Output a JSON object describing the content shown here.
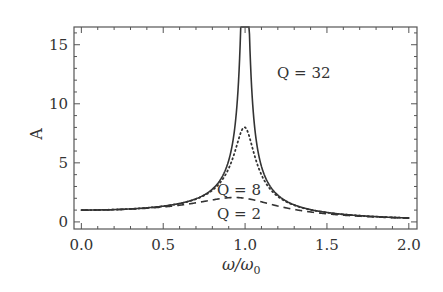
{
  "chart_data": {
    "type": "line",
    "title": "",
    "xlabel": "ω/ω",
    "xlabel_subscript": "0",
    "ylabel": "A",
    "xlim": [
      -0.045,
      2.05
    ],
    "ylim": [
      -0.6,
      16.5
    ],
    "grid": false,
    "x_ticks": [
      0.0,
      0.5,
      1.0,
      1.5,
      2.0
    ],
    "x_tick_labels": [
      "0.0",
      "0.5",
      "1.0",
      "1.5",
      "2.0"
    ],
    "y_ticks": [
      0,
      5,
      10,
      15
    ],
    "y_tick_labels": [
      "0",
      "5",
      "10",
      "15"
    ],
    "formula": "A = 1/sqrt((1-x^2)^2 + (x/Q)^2)",
    "x": [
      0.0,
      0.25,
      0.5,
      0.75,
      0.9,
      0.95,
      1.0,
      1.05,
      1.1,
      1.25,
      1.5,
      1.75,
      2.0
    ],
    "series": [
      {
        "name": "Q = 32",
        "style": "solid",
        "Q": 32,
        "values": [
          1.0,
          1.07,
          1.33,
          2.28,
          5.19,
          9.6,
          16.0,
          8.9,
          4.6,
          1.77,
          0.8,
          0.48,
          0.33
        ]
      },
      {
        "name": "Q = 8",
        "style": "dotted",
        "Q": 8,
        "values": [
          1.0,
          1.07,
          1.33,
          2.24,
          4.8,
          7.0,
          8.0,
          6.6,
          4.3,
          1.75,
          0.8,
          0.48,
          0.33
        ]
      },
      {
        "name": "Q = 2",
        "style": "dashed",
        "Q": 2,
        "values": [
          1.0,
          1.06,
          1.28,
          1.87,
          2.08,
          2.06,
          2.0,
          1.9,
          1.73,
          1.25,
          0.71,
          0.45,
          0.32
        ]
      }
    ],
    "annotations": [
      {
        "text": "Q = 32",
        "x": 1.13,
        "y": 12.3
      },
      {
        "text": "Q = 8",
        "x": 0.87,
        "y": 2.9
      },
      {
        "text": "Q = 2",
        "x": 0.87,
        "y": 0.8
      }
    ],
    "legend": "none (inline annotations)"
  },
  "labels": {
    "q32": "Q = 32",
    "q8": "Q = 8",
    "q2": "Q = 2",
    "ylabel": "A",
    "xlabel_main": "ω/ω",
    "xlabel_sub": "0"
  }
}
